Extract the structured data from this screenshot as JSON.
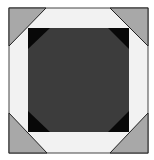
{
  "figure": {
    "colors": {
      "background": "#ffffff",
      "corner_triangles": "#a8a8a8",
      "ring": "#f2f2f2",
      "inner_corners": "#080808",
      "center": "#3c3c3c",
      "outline": "#222222"
    }
  }
}
